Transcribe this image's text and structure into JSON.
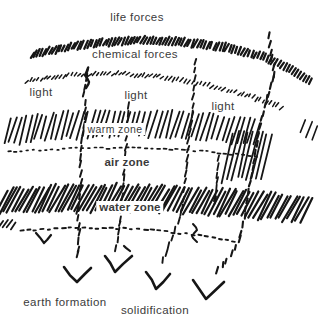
{
  "colors": {
    "ink": "#161616",
    "text": "#3b3b3b",
    "background": "#ffffff"
  },
  "labels": {
    "life_forces": "life forces",
    "chemical_forces": "chemical forces",
    "light_left": "light",
    "light_center": "light",
    "light_right": "light",
    "warm_zone": "warm zone",
    "air_zone": "air zone",
    "water_zone": "water zone",
    "earth_formation": "earth formation",
    "solidification": "solidification"
  }
}
